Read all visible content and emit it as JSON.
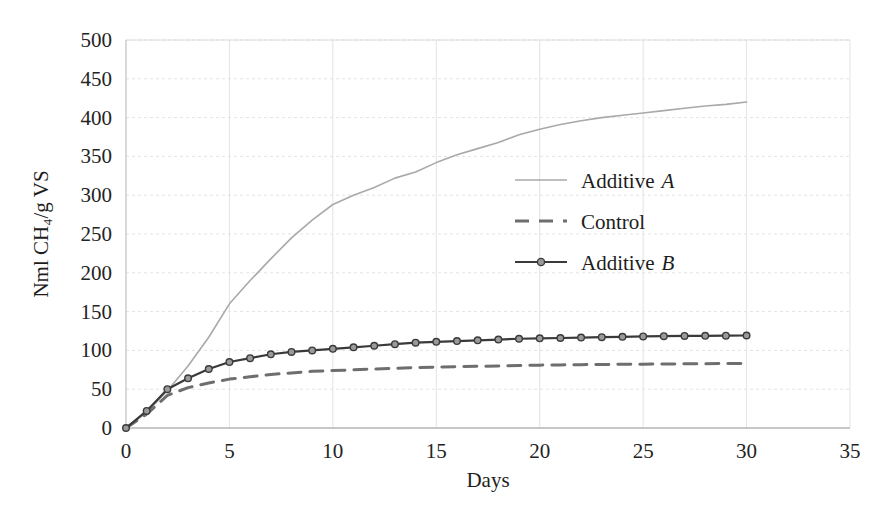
{
  "chart_data": {
    "type": "line",
    "title": "",
    "xlabel": "Days",
    "ylabel": "Nml CH4/g VS",
    "ylabel_display": "Nml CH₄/g VS",
    "xlim": [
      0,
      35
    ],
    "ylim": [
      0,
      500
    ],
    "xticks": [
      0,
      5,
      10,
      15,
      20,
      25,
      30,
      35
    ],
    "yticks": [
      0,
      50,
      100,
      150,
      200,
      250,
      300,
      350,
      400,
      450,
      500
    ],
    "xtick_labels": [
      "0",
      "5",
      "10",
      "15",
      "20",
      "25",
      "30",
      "35"
    ],
    "ytick_labels": [
      "0",
      "50",
      "100",
      "150",
      "200",
      "250",
      "300",
      "350",
      "400",
      "450",
      "500"
    ],
    "grid": true,
    "grid_color": "#e3e3e3",
    "legend_position": "center-right-inside",
    "x": [
      0,
      1,
      2,
      3,
      4,
      5,
      6,
      7,
      8,
      9,
      10,
      11,
      12,
      13,
      14,
      15,
      16,
      17,
      18,
      19,
      20,
      21,
      22,
      23,
      24,
      25,
      26,
      27,
      28,
      29,
      30
    ],
    "series": [
      {
        "name": "Additive A",
        "name_plain": "Additive",
        "name_italic": "A",
        "color": "#a9a9a9",
        "line_style": "solid",
        "marker": "none",
        "line_width": 1.6,
        "values": [
          0,
          20,
          48,
          80,
          117,
          160,
          190,
          218,
          245,
          268,
          288,
          300,
          310,
          322,
          330,
          342,
          352,
          360,
          368,
          378,
          385,
          391,
          396,
          400,
          403,
          406,
          409,
          412,
          415,
          417,
          420
        ]
      },
      {
        "name": "Control",
        "name_plain": "Control",
        "name_italic": "",
        "color": "#6e6e6e",
        "line_style": "dashed",
        "marker": "none",
        "line_width": 3.0,
        "values": [
          0,
          18,
          42,
          52,
          58,
          63,
          66,
          69,
          71,
          73,
          74,
          75,
          76,
          77,
          78,
          78.5,
          79,
          79.5,
          80,
          80.5,
          81,
          81.3,
          81.6,
          81.9,
          82.1,
          82.3,
          82.5,
          82.7,
          82.9,
          83,
          83.2
        ]
      },
      {
        "name": "Additive B",
        "name_plain": "Additive",
        "name_italic": "B",
        "color": "#3a3a3a",
        "line_style": "solid",
        "marker": "circle",
        "line_width": 2.2,
        "values": [
          0,
          22,
          50,
          64,
          76,
          85,
          90,
          95,
          98,
          100,
          102,
          104,
          106,
          108,
          110,
          111,
          112,
          113,
          114,
          115,
          115.5,
          116,
          116.5,
          117,
          117.5,
          118,
          118.3,
          118.6,
          118.8,
          119,
          119.2
        ]
      }
    ],
    "annotations": []
  },
  "legend": {
    "entries": [
      {
        "label_plain": "Additive",
        "label_italic": "A"
      },
      {
        "label_plain": "Control",
        "label_italic": ""
      },
      {
        "label_plain": "Additive",
        "label_italic": "B"
      }
    ]
  },
  "axes": {
    "x_title": "Days",
    "y_title": "Nml CH₄/g VS"
  }
}
